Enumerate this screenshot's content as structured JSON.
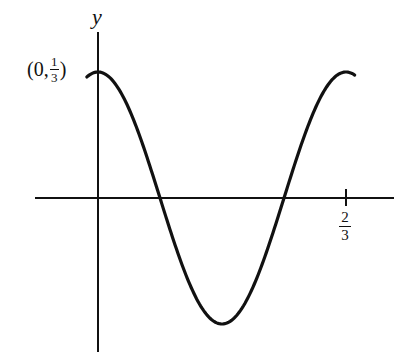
{
  "chart_data": {
    "type": "line",
    "title": "",
    "function": "y = (1/3) cos(3πx)",
    "xlabel": "",
    "ylabel": "y",
    "x_ticks": [
      {
        "value": 0.6667,
        "label_num": "2",
        "label_den": "3"
      }
    ],
    "annotations": [
      {
        "text": "(0, 1/3)",
        "point": [
          0,
          0.3333
        ],
        "prefix": "(0, ",
        "num": "1",
        "den": "3",
        "suffix": ")"
      }
    ],
    "x": [
      -0.02,
      0,
      0.0833,
      0.1667,
      0.25,
      0.3333,
      0.4167,
      0.5,
      0.5833,
      0.6667,
      0.69
    ],
    "values": [
      0.324,
      0.3333,
      0.2357,
      0,
      -0.2357,
      -0.3333,
      -0.2357,
      0,
      0.2357,
      0.3333,
      0.3243
    ],
    "xlim": [
      -0.17,
      0.95
    ],
    "ylim": [
      -0.4,
      0.5
    ],
    "grid": false,
    "legend": null,
    "colors": {
      "curve": "#111111",
      "axis": "#111111"
    }
  }
}
